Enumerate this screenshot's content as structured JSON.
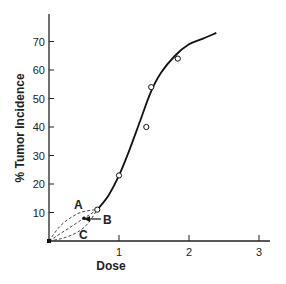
{
  "chart_data": {
    "type": "scatter",
    "title": "",
    "xlabel": "Dose",
    "ylabel": "% Tumor Incidence",
    "xlim": [
      0,
      3.2
    ],
    "ylim": [
      0,
      80
    ],
    "x_ticks": [
      1,
      2,
      3
    ],
    "y_ticks": [
      10,
      20,
      30,
      40,
      50,
      60,
      70
    ],
    "grid": false,
    "legend": null,
    "series": [
      {
        "name": "observed",
        "kind": "points",
        "marker": "open-circle",
        "x": [
          0.69,
          1.0,
          1.39,
          1.46,
          1.84
        ],
        "y": [
          11,
          23,
          40,
          54,
          64
        ]
      },
      {
        "name": "fitted dose-response curve",
        "kind": "line",
        "style": "solid",
        "x": [
          0.69,
          0.85,
          1.0,
          1.15,
          1.3,
          1.45,
          1.6,
          1.8,
          2.0,
          2.2,
          2.39
        ],
        "y": [
          11,
          16,
          23,
          32,
          42,
          52,
          59,
          65,
          69,
          71,
          73
        ]
      },
      {
        "name": "A",
        "kind": "line",
        "style": "dashed",
        "shape": "concave (supralinear)",
        "x": [
          0,
          0.15,
          0.3,
          0.45,
          0.6,
          0.69
        ],
        "y": [
          0,
          5,
          8,
          10,
          10.8,
          11
        ]
      },
      {
        "name": "B",
        "kind": "line",
        "style": "dashed",
        "shape": "linear",
        "x": [
          0,
          0.69
        ],
        "y": [
          0,
          11
        ]
      },
      {
        "name": "C",
        "kind": "line",
        "style": "dashed",
        "shape": "convex (sublinear)",
        "x": [
          0,
          0.2,
          0.4,
          0.55,
          0.69
        ],
        "y": [
          0,
          1,
          3,
          6,
          11
        ]
      }
    ],
    "annotations": [
      {
        "text": "A",
        "x": 0.4,
        "y": 13
      },
      {
        "text": "B",
        "x": 0.85,
        "y": 7
      },
      {
        "text": "C",
        "x": 0.5,
        "y": 2
      },
      {
        "text": "arrow",
        "from_x": 0.8,
        "from_y": 8,
        "to_x": 0.5,
        "to_y": 8
      }
    ]
  },
  "axes": {
    "x_title": "Dose",
    "y_title": "% Tumor Incidence",
    "x_tick_labels": [
      "1",
      "2",
      "3"
    ],
    "y_tick_labels": [
      "10",
      "20",
      "30",
      "40",
      "50",
      "60",
      "70"
    ]
  },
  "labels": {
    "a": "A",
    "b": "B",
    "c": "C"
  },
  "colors": {
    "ink": "#222222",
    "background": "#ffffff"
  }
}
